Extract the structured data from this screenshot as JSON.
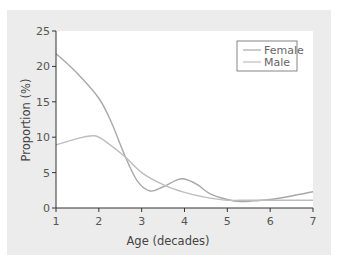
{
  "chart_data": {
    "type": "line",
    "title": "",
    "xlabel": "Age (decades)",
    "ylabel": "Proportion (%)",
    "xlim": [
      1,
      7
    ],
    "ylim": [
      0,
      25
    ],
    "xticks": [
      1,
      2,
      3,
      4,
      5,
      6,
      7
    ],
    "yticks": [
      0,
      5,
      10,
      15,
      20,
      25
    ],
    "grid": false,
    "legend_position": "upper right",
    "series": [
      {
        "name": "Female",
        "color": "#a8a8a8",
        "x": [
          1,
          1.5,
          2,
          2.3,
          2.6,
          2.9,
          3.2,
          3.5,
          3.8,
          4.0,
          4.3,
          4.6,
          5.0,
          5.3,
          5.6,
          6.0,
          6.5,
          7.0
        ],
        "y": [
          21.8,
          19.0,
          15.5,
          12.0,
          7.5,
          3.8,
          2.4,
          3.0,
          3.9,
          4.1,
          3.3,
          2.0,
          1.2,
          0.9,
          1.0,
          1.2,
          1.7,
          2.3
        ]
      },
      {
        "name": "Male",
        "color": "#bdbdbd",
        "x": [
          1,
          1.5,
          1.9,
          2.2,
          2.6,
          3.0,
          3.5,
          4.0,
          4.5,
          5.0,
          5.5,
          6.0,
          6.5,
          7.0
        ],
        "y": [
          8.9,
          9.8,
          10.2,
          9.2,
          7.3,
          5.0,
          3.3,
          2.2,
          1.5,
          1.1,
          1.1,
          1.1,
          1.1,
          1.1
        ]
      }
    ]
  },
  "axes": {
    "xlabel": "Age (decades)",
    "ylabel": "Proportion (%)",
    "xtick_labels": [
      "1",
      "2",
      "3",
      "4",
      "5",
      "6",
      "7"
    ],
    "ytick_labels": [
      "0",
      "5",
      "10",
      "15",
      "20",
      "25"
    ]
  },
  "legend": {
    "items": [
      {
        "label": "Female",
        "color": "#a8a8a8"
      },
      {
        "label": "Male",
        "color": "#bdbdbd"
      }
    ]
  }
}
